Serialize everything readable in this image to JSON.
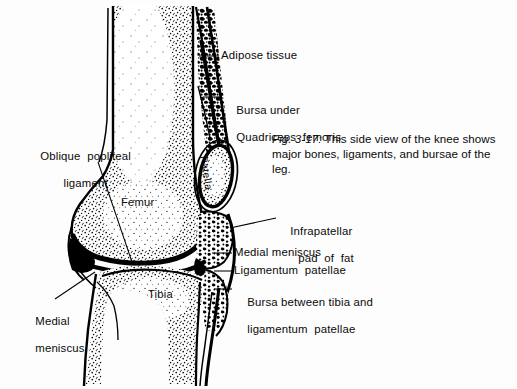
{
  "figure": {
    "caption_prefix": "Fig. 3-17:",
    "caption_text": " This side view of the knee shows major bones, ligaments, and bursae of the leg.",
    "background_color": "#fdfdfd",
    "ink_color": "#000000"
  },
  "bone_labels": [
    {
      "name": "femur",
      "text": "Femur"
    },
    {
      "name": "tibia",
      "text": "Tibia"
    },
    {
      "name": "patella",
      "text": "Patella"
    }
  ],
  "callouts": {
    "adipose_tissue": {
      "text": "Adipose tissue"
    },
    "bursa_under_quadriceps": {
      "line1": "Bursa under",
      "line2": "Quadriceps  femoris"
    },
    "oblique_popliteal_ligament": {
      "line1": "Oblique  popliteal",
      "line2": "ligament"
    },
    "medial_meniscus_left": {
      "line1": "Medial",
      "line2": "meniscus"
    },
    "infrapatellar_pad_of_fat": {
      "line1": "Infrapatellar",
      "line2": "pad  of  fat"
    },
    "medial_meniscus_right": {
      "text": "Medial meniscus"
    },
    "ligamentum_patellae": {
      "text": "Ligamentum  patellae"
    },
    "bursa_between_tibia": {
      "line1": "Bursa between tibia and",
      "line2": "ligamentum  patellae"
    }
  }
}
